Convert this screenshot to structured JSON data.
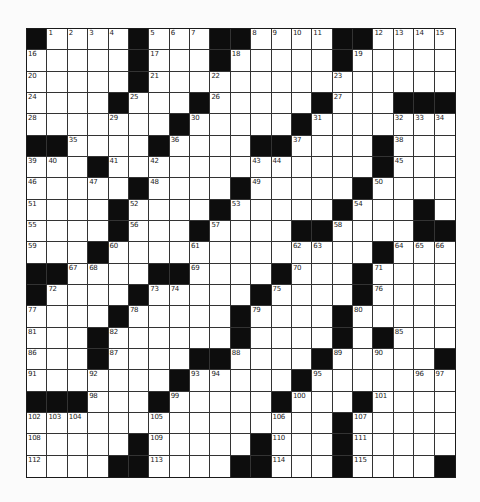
{
  "puzzle": {
    "rows": 21,
    "cols": 21,
    "colors": {
      "block": "#0d0d0d",
      "cell": "#ffffff",
      "line": "#333333",
      "background": "#fbfbfb"
    },
    "layout": [
      "#....#...##....##....",
      ".....#...#.....#.....",
      ".....#...............",
      "....#...#.....#...###",
      ".......#.....#.......",
      "##....#....##....#...",
      "...#.............#...",
      ".....#....#.....#....",
      "....#....#.....#...#",
      "....#...#....##....##",
      "...#.............#...",
      "##....##....#...#....",
      "#....#.....#....#....",
      "....#.....#....#.....",
      "...#......#....#.#...",
      "...#....##....#.....##",
      ".......#.....#.......",
      "###...#.....#...#....",
      "...............#.....",
      ".....#.....#...#.....",
      "....##....##...#....#"
    ],
    "numbers": [
      {
        "r": 0,
        "c": 1,
        "n": "1"
      },
      {
        "r": 0,
        "c": 2,
        "n": "2"
      },
      {
        "r": 0,
        "c": 3,
        "n": "3"
      },
      {
        "r": 0,
        "c": 4,
        "n": "4"
      },
      {
        "r": 0,
        "c": 6,
        "n": "5"
      },
      {
        "r": 0,
        "c": 7,
        "n": "6"
      },
      {
        "r": 0,
        "c": 8,
        "n": "7"
      },
      {
        "r": 0,
        "c": 11,
        "n": "8"
      },
      {
        "r": 0,
        "c": 12,
        "n": "9"
      },
      {
        "r": 0,
        "c": 13,
        "n": "10"
      },
      {
        "r": 0,
        "c": 14,
        "n": "11"
      },
      {
        "r": 0,
        "c": 17,
        "n": "12"
      },
      {
        "r": 0,
        "c": 18,
        "n": "13"
      },
      {
        "r": 0,
        "c": 19,
        "n": "14"
      },
      {
        "r": 0,
        "c": 20,
        "n": "15"
      },
      {
        "r": 1,
        "c": 0,
        "n": "16"
      },
      {
        "r": 1,
        "c": 6,
        "n": "17"
      },
      {
        "r": 1,
        "c": 10,
        "n": "18"
      },
      {
        "r": 1,
        "c": 16,
        "n": "19"
      },
      {
        "r": 2,
        "c": 0,
        "n": "20"
      },
      {
        "r": 2,
        "c": 6,
        "n": "21"
      },
      {
        "r": 2,
        "c": 9,
        "n": "22"
      },
      {
        "r": 2,
        "c": 15,
        "n": "23"
      },
      {
        "r": 3,
        "c": 0,
        "n": "24"
      },
      {
        "r": 3,
        "c": 5,
        "n": "25"
      },
      {
        "r": 3,
        "c": 9,
        "n": "26"
      },
      {
        "r": 3,
        "c": 15,
        "n": "27"
      },
      {
        "r": 4,
        "c": 0,
        "n": "28"
      },
      {
        "r": 4,
        "c": 4,
        "n": "29"
      },
      {
        "r": 4,
        "c": 8,
        "n": "30"
      },
      {
        "r": 4,
        "c": 14,
        "n": "31"
      },
      {
        "r": 4,
        "c": 18,
        "n": "32"
      },
      {
        "r": 4,
        "c": 19,
        "n": "33"
      },
      {
        "r": 4,
        "c": 20,
        "n": "34"
      },
      {
        "r": 5,
        "c": 2,
        "n": "35"
      },
      {
        "r": 5,
        "c": 7,
        "n": "36"
      },
      {
        "r": 5,
        "c": 13,
        "n": "37"
      },
      {
        "r": 5,
        "c": 18,
        "n": "38"
      },
      {
        "r": 6,
        "c": 0,
        "n": "39"
      },
      {
        "r": 6,
        "c": 1,
        "n": "40"
      },
      {
        "r": 6,
        "c": 4,
        "n": "41"
      },
      {
        "r": 6,
        "c": 6,
        "n": "42"
      },
      {
        "r": 6,
        "c": 11,
        "n": "43"
      },
      {
        "r": 6,
        "c": 12,
        "n": "44"
      },
      {
        "r": 6,
        "c": 18,
        "n": "45"
      },
      {
        "r": 7,
        "c": 0,
        "n": "46"
      },
      {
        "r": 7,
        "c": 3,
        "n": "47"
      },
      {
        "r": 7,
        "c": 6,
        "n": "48"
      },
      {
        "r": 7,
        "c": 11,
        "n": "49"
      },
      {
        "r": 7,
        "c": 17,
        "n": "50"
      },
      {
        "r": 8,
        "c": 0,
        "n": "51"
      },
      {
        "r": 8,
        "c": 5,
        "n": "52"
      },
      {
        "r": 8,
        "c": 10,
        "n": "53"
      },
      {
        "r": 8,
        "c": 16,
        "n": "54"
      },
      {
        "r": 9,
        "c": 0,
        "n": "55"
      },
      {
        "r": 9,
        "c": 5,
        "n": "56"
      },
      {
        "r": 9,
        "c": 9,
        "n": "57"
      },
      {
        "r": 9,
        "c": 15,
        "n": "58"
      },
      {
        "r": 10,
        "c": 0,
        "n": "59"
      },
      {
        "r": 10,
        "c": 4,
        "n": "60"
      },
      {
        "r": 10,
        "c": 8,
        "n": "61"
      },
      {
        "r": 10,
        "c": 13,
        "n": "62"
      },
      {
        "r": 10,
        "c": 14,
        "n": "63"
      },
      {
        "r": 10,
        "c": 18,
        "n": "64"
      },
      {
        "r": 10,
        "c": 19,
        "n": "65"
      },
      {
        "r": 10,
        "c": 20,
        "n": "66"
      },
      {
        "r": 11,
        "c": 2,
        "n": "67"
      },
      {
        "r": 11,
        "c": 3,
        "n": "68"
      },
      {
        "r": 11,
        "c": 8,
        "n": "69"
      },
      {
        "r": 11,
        "c": 13,
        "n": "70"
      },
      {
        "r": 11,
        "c": 17,
        "n": "71"
      },
      {
        "r": 12,
        "c": 1,
        "n": "72"
      },
      {
        "r": 12,
        "c": 6,
        "n": "73"
      },
      {
        "r": 12,
        "c": 7,
        "n": "74"
      },
      {
        "r": 12,
        "c": 12,
        "n": "75"
      },
      {
        "r": 12,
        "c": 17,
        "n": "76"
      },
      {
        "r": 13,
        "c": 0,
        "n": "77"
      },
      {
        "r": 13,
        "c": 5,
        "n": "78"
      },
      {
        "r": 13,
        "c": 11,
        "n": "79"
      },
      {
        "r": 13,
        "c": 16,
        "n": "80"
      },
      {
        "r": 14,
        "c": 0,
        "n": "81"
      },
      {
        "r": 14,
        "c": 4,
        "n": "82"
      },
      {
        "r": 14,
        "c": 10,
        "n": "83"
      },
      {
        "r": 14,
        "c": 15,
        "n": "84"
      },
      {
        "r": 14,
        "c": 18,
        "n": "85"
      },
      {
        "r": 15,
        "c": 0,
        "n": "86"
      },
      {
        "r": 15,
        "c": 4,
        "n": "87"
      },
      {
        "r": 15,
        "c": 10,
        "n": "88"
      },
      {
        "r": 15,
        "c": 15,
        "n": "89"
      },
      {
        "r": 15,
        "c": 17,
        "n": "90"
      },
      {
        "r": 16,
        "c": 0,
        "n": "91"
      },
      {
        "r": 16,
        "c": 3,
        "n": "92"
      },
      {
        "r": 16,
        "c": 8,
        "n": "93"
      },
      {
        "r": 16,
        "c": 9,
        "n": "94"
      },
      {
        "r": 16,
        "c": 14,
        "n": "95"
      },
      {
        "r": 16,
        "c": 19,
        "n": "96"
      },
      {
        "r": 16,
        "c": 20,
        "n": "97"
      },
      {
        "r": 17,
        "c": 3,
        "n": "98"
      },
      {
        "r": 17,
        "c": 7,
        "n": "99"
      },
      {
        "r": 17,
        "c": 13,
        "n": "100"
      },
      {
        "r": 17,
        "c": 17,
        "n": "101"
      },
      {
        "r": 18,
        "c": 0,
        "n": "102"
      },
      {
        "r": 18,
        "c": 1,
        "n": "103"
      },
      {
        "r": 18,
        "c": 2,
        "n": "104"
      },
      {
        "r": 18,
        "c": 6,
        "n": "105"
      },
      {
        "r": 18,
        "c": 12,
        "n": "106"
      },
      {
        "r": 18,
        "c": 16,
        "n": "107"
      },
      {
        "r": 19,
        "c": 0,
        "n": "108"
      },
      {
        "r": 19,
        "c": 6,
        "n": "109"
      },
      {
        "r": 19,
        "c": 12,
        "n": "110"
      },
      {
        "r": 19,
        "c": 16,
        "n": "111"
      },
      {
        "r": 20,
        "c": 0,
        "n": "112"
      },
      {
        "r": 20,
        "c": 6,
        "n": "113"
      },
      {
        "r": 20,
        "c": 12,
        "n": "114"
      },
      {
        "r": 20,
        "c": 16,
        "n": "115"
      }
    ]
  }
}
